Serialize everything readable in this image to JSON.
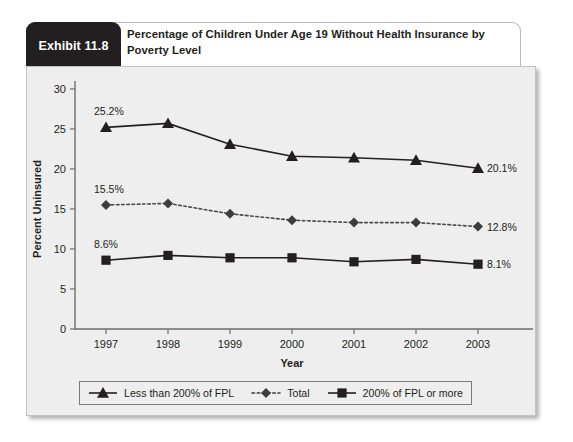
{
  "exhibit": {
    "tab_label": "Exhibit 11.8",
    "title": "Percentage of Children Under Age 19 Without Health Insurance by Poverty Level"
  },
  "chart_data": {
    "type": "line",
    "title": "Percentage of Children Under Age 19 Without Health Insurance by Poverty Level",
    "xlabel": "Year",
    "ylabel": "Percent Uninsured",
    "categories": [
      "1997",
      "1998",
      "1999",
      "2000",
      "2001",
      "2002",
      "2003"
    ],
    "ylim": [
      0,
      30
    ],
    "yticks": [
      "0",
      "5",
      "10",
      "15",
      "20",
      "25",
      "30"
    ],
    "grid": false,
    "legend_position": "bottom",
    "series": [
      {
        "name": "Less than 200% of FPL",
        "marker": "triangle",
        "linestyle": "solid",
        "color": "#231f20",
        "values": [
          25.2,
          25.7,
          23.1,
          21.6,
          21.4,
          21.1,
          20.1
        ],
        "start_label": "25.2%",
        "end_label": "20.1%"
      },
      {
        "name": "Total",
        "marker": "diamond",
        "linestyle": "dotted",
        "color": "#3d3d3d",
        "values": [
          15.5,
          15.7,
          14.4,
          13.6,
          13.3,
          13.3,
          12.8
        ],
        "start_label": "15.5%",
        "end_label": "12.8%"
      },
      {
        "name": "200% of FPL or more",
        "marker": "square",
        "linestyle": "solid",
        "color": "#231f20",
        "values": [
          8.6,
          9.2,
          8.9,
          8.9,
          8.4,
          8.7,
          8.1
        ],
        "start_label": "8.6%",
        "end_label": "8.1%"
      }
    ]
  }
}
